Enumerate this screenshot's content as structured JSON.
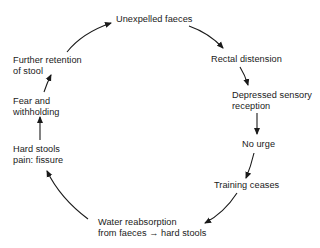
{
  "diagram": {
    "type": "cycle",
    "nodes": [
      {
        "id": "unexpelled",
        "lines": [
          "Unexpelled faeces"
        ]
      },
      {
        "id": "rectal",
        "lines": [
          "Rectal distension"
        ]
      },
      {
        "id": "depressed",
        "lines": [
          "Depressed sensory",
          "reception"
        ]
      },
      {
        "id": "nourge",
        "lines": [
          "No urge"
        ]
      },
      {
        "id": "training",
        "lines": [
          "Training ceases"
        ]
      },
      {
        "id": "water",
        "lines": [
          "Water reabsorption",
          "from faeces → hard stools"
        ]
      },
      {
        "id": "hardstools",
        "lines": [
          "Hard stools",
          "pain: fissure"
        ]
      },
      {
        "id": "fear",
        "lines": [
          "Fear and",
          "withholding"
        ]
      },
      {
        "id": "further",
        "lines": [
          "Further retention",
          "of stool"
        ]
      }
    ],
    "edges": [
      {
        "from": "further",
        "to": "unexpelled"
      },
      {
        "from": "unexpelled",
        "to": "rectal"
      },
      {
        "from": "rectal",
        "to": "depressed"
      },
      {
        "from": "depressed",
        "to": "nourge"
      },
      {
        "from": "nourge",
        "to": "training"
      },
      {
        "from": "training",
        "to": "water"
      },
      {
        "from": "water",
        "to": "hardstools"
      },
      {
        "from": "hardstools",
        "to": "fear"
      },
      {
        "from": "fear",
        "to": "further"
      }
    ]
  }
}
